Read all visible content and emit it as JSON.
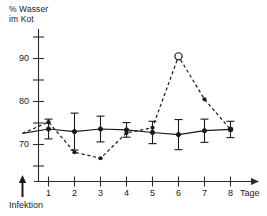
{
  "axis": {
    "y_title_line1": "% Wasser",
    "y_title_line2": "im Kot",
    "x_unit_label": "Tage",
    "infection_label": "Infektion"
  },
  "chart_data": {
    "type": "line",
    "title": "",
    "xlabel": "Tage",
    "ylabel": "% Wasser im Kot",
    "xlim": [
      0,
      8.8
    ],
    "ylim": [
      64.5,
      93.5
    ],
    "grid": false,
    "legend": "none",
    "y_ticks_major": [
      70,
      80,
      90
    ],
    "y_ticks_minor": [
      75,
      85,
      92.5
    ],
    "x_ticks": [
      1,
      2,
      3,
      4,
      5,
      6,
      7,
      8
    ],
    "x_tick_labels": [
      "1",
      "2",
      "3",
      "4",
      "5",
      "6",
      "7",
      "8"
    ],
    "annotations": [
      {
        "text": "Infektion",
        "x": 0,
        "y": 65,
        "marker": "up-arrow"
      }
    ],
    "series": [
      {
        "name": "Kontrolle",
        "style": "solid",
        "marker": "filled-circle",
        "x": [
          0,
          1,
          2,
          3,
          4,
          5,
          6,
          7,
          8
        ],
        "values": [
          72.6,
          73.6,
          73.0,
          73.6,
          73.4,
          72.8,
          72.3,
          73.2,
          73.5
        ],
        "err_low": [
          0.0,
          2.3,
          4.3,
          3.0,
          1.7,
          2.6,
          3.5,
          2.7,
          1.9
        ],
        "err_high": [
          0.0,
          2.3,
          4.3,
          3.0,
          1.7,
          2.6,
          3.5,
          2.7,
          1.9
        ]
      },
      {
        "name": "Infiziert",
        "style": "dashed",
        "marker": "filled-circle",
        "x": [
          0,
          1,
          2,
          3,
          4,
          5,
          6,
          7,
          8
        ],
        "values": [
          72.6,
          75.2,
          68.2,
          66.8,
          72.7,
          73.9,
          90.5,
          80.5,
          73.5
        ],
        "open_marker_x": [
          6
        ]
      }
    ]
  }
}
